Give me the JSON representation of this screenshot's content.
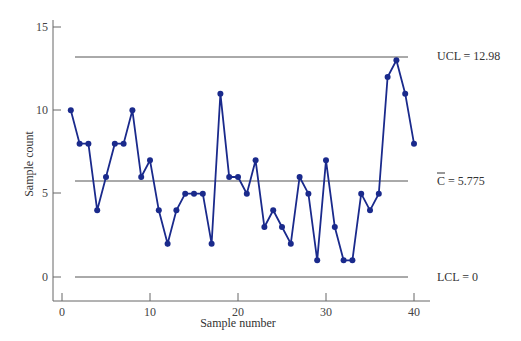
{
  "chart_data": {
    "type": "line",
    "title": "",
    "xlabel": "Sample number",
    "ylabel": "Sample count",
    "xlim": [
      0,
      40
    ],
    "ylim": [
      0,
      15
    ],
    "xticks": [
      0,
      10,
      20,
      30,
      40
    ],
    "yticks": [
      0,
      5,
      10,
      15
    ],
    "grid": false,
    "x": [
      1,
      2,
      3,
      4,
      5,
      6,
      7,
      8,
      9,
      10,
      11,
      12,
      13,
      14,
      15,
      16,
      17,
      18,
      19,
      20,
      21,
      22,
      23,
      24,
      25,
      26,
      27,
      28,
      29,
      30,
      31,
      32,
      33,
      34,
      35,
      36,
      37,
      38,
      39,
      40
    ],
    "series": [
      {
        "name": "Sample count",
        "color": "#1a2a8c",
        "values": [
          10,
          8,
          8,
          4,
          6,
          8,
          8,
          10,
          6,
          7,
          4,
          2,
          4,
          5,
          5,
          5,
          2,
          11,
          6,
          6,
          5,
          7,
          3,
          4,
          3,
          2,
          6,
          5,
          1,
          7,
          3,
          1,
          1,
          5,
          4,
          5,
          12,
          13,
          11,
          8
        ]
      }
    ],
    "control_lines": [
      {
        "name": "UCL",
        "value": 12.98,
        "label": "UCL = 12.98"
      },
      {
        "name": "C-bar",
        "value": 5.775,
        "label_prefix": "C",
        "label_suffix": " = 5.775"
      },
      {
        "name": "LCL",
        "value": 0,
        "label": "LCL = 0"
      }
    ]
  },
  "labels": {
    "xlabel": "Sample number",
    "ylabel": "Sample count",
    "ucl": "UCL = 12.98",
    "center_symbol": "C",
    "center_value": " = 5.775",
    "lcl": "LCL = 0",
    "x0": "0",
    "x10": "10",
    "x20": "20",
    "x30": "30",
    "x40": "40",
    "y0": "0",
    "y5": "5",
    "y10": "10",
    "y15": "15"
  }
}
